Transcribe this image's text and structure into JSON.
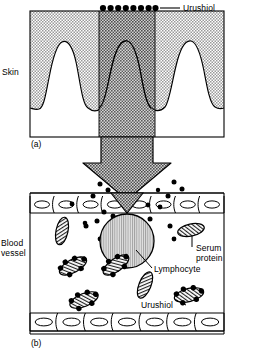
{
  "figure": {
    "panels": [
      {
        "id": "a",
        "marker": "(a)",
        "description": "Cross-section of skin with urushiol applied to the surface",
        "labels": {
          "skin": "Skin",
          "urushiol": "Urushiol"
        },
        "surface_dot_count": 8,
        "rete_ridge_count": 3
      },
      {
        "id": "b",
        "marker": "(b)",
        "description": "Blood vessel lumen containing lymphocyte, serum proteins and urushiol-protein conjugates",
        "labels": {
          "blood_vessel": "Blood\nvessel",
          "serum_protein": "Serum\nprotein",
          "lymphocyte": "Lymphocyte",
          "urushiol": "Urushiol"
        },
        "endothelial_cells_top": 8,
        "endothelial_cells_bottom": 7,
        "serum_protein_count": 3,
        "conjugate_count": 4,
        "lymphocyte_count": 1,
        "free_urushiol_dot_count": 22
      }
    ],
    "colors": {
      "stipple_light": "#d9d9d9",
      "stipple_dark": "#b0b0b0",
      "outline": "#000000",
      "lymphocyte_fill": "#c8c8c8",
      "background": "#ffffff"
    }
  }
}
